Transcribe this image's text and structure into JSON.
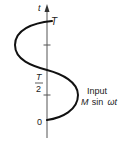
{
  "diagram": {
    "axis": {
      "label": "t"
    },
    "ticks": [
      {
        "label": "0"
      },
      {
        "label_num": "T",
        "label_den": "2"
      },
      {
        "label": "T"
      }
    ],
    "curve": {
      "shape": "one period of sine wave plotted along vertical time axis"
    },
    "annotation": {
      "line1": "Input",
      "line2_var": "M",
      "line2_fn": "sin",
      "line2_arg": "ωt"
    }
  }
}
